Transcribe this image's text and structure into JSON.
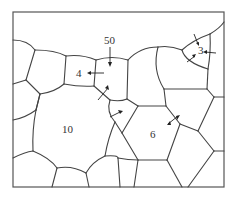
{
  "diagram": {
    "type": "grain-structure",
    "grain_labels": [
      {
        "id": "grain-3",
        "text": "3",
        "x": 198,
        "y": 51
      },
      {
        "id": "grain-4",
        "text": "4",
        "x": 76,
        "y": 77
      },
      {
        "id": "grain-50",
        "text": "50",
        "x": 104,
        "y": 44
      },
      {
        "id": "grain-10",
        "text": "10",
        "x": 60,
        "y": 133
      },
      {
        "id": "grain-6",
        "text": "6",
        "x": 149,
        "y": 138
      }
    ],
    "colors": {
      "boundary": "#444444",
      "frame": "#555555",
      "arrow": "#222222",
      "background": "#ffffff"
    }
  }
}
